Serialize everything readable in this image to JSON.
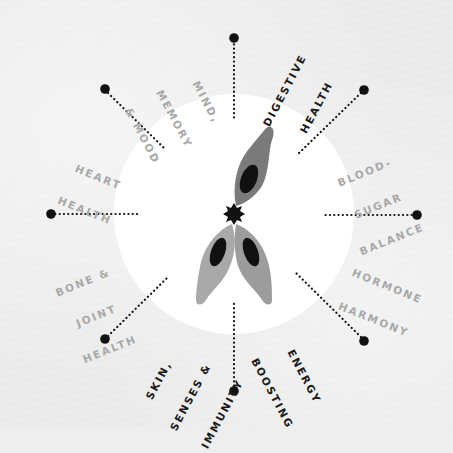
{
  "diagram": {
    "center": {
      "x": 234,
      "y": 214
    },
    "inner_circle_radius": 120,
    "colors": {
      "background": "#ececec",
      "inner_circle": "#ffffff",
      "spoke": "#111111",
      "leaf_dark": "#7a7a7a",
      "leaf_light": "#a9a9a9",
      "leaf_light2": "#9c9c9c",
      "nucleus": "#111111",
      "label_dark": "#1a1a1a",
      "label_light": "#a8a8a8"
    },
    "icon": "cell-cluster-icon",
    "labels": [
      {
        "id": "digestive-health",
        "lines": [
          "DIGESTIVE",
          "HEALTH"
        ],
        "style": "dark"
      },
      {
        "id": "blood-sugar-balance",
        "lines": [
          "BLOOD-",
          "SUGAR",
          "BALANCE"
        ],
        "style": "light"
      },
      {
        "id": "hormone-harmony",
        "lines": [
          "HORMONE",
          "HARMONY"
        ],
        "style": "light"
      },
      {
        "id": "energy-boosting",
        "lines": [
          "ENERGY",
          "BOOSTING"
        ],
        "style": "dark"
      },
      {
        "id": "skin-senses-immunity",
        "lines": [
          "SKIN,",
          "SENSES &",
          "IMMUNITY"
        ],
        "style": "dark"
      },
      {
        "id": "bone-joint-health",
        "lines": [
          "BONE &",
          "JOINT",
          "HEALTH"
        ],
        "style": "light"
      },
      {
        "id": "heart-health",
        "lines": [
          "HEART",
          "HEALTH"
        ],
        "style": "light"
      },
      {
        "id": "mind-memory-mood",
        "lines": [
          "MIND,",
          "MEMORY",
          "& MOOD"
        ],
        "style": "light"
      }
    ]
  }
}
